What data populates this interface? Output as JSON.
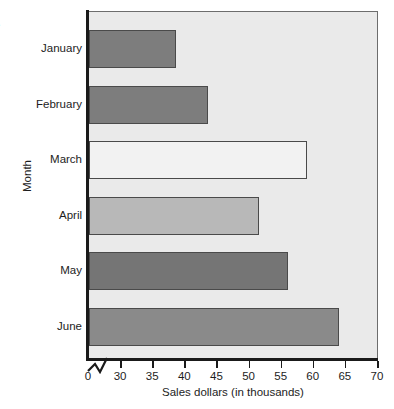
{
  "clipped_title_fragment": "e",
  "chart_data": {
    "type": "bar",
    "orientation": "horizontal",
    "title": "",
    "categories": [
      "January",
      "February",
      "March",
      "April",
      "May",
      "June"
    ],
    "values": [
      38.5,
      43.5,
      59,
      51.5,
      56,
      64
    ],
    "series": [
      {
        "name": "Sales dollars (in thousands)",
        "values": [
          38.5,
          43.5,
          59,
          51.5,
          56,
          64
        ]
      }
    ],
    "bar_colors": [
      "#7d7d7d",
      "#7d7d7d",
      "#f2f2f2",
      "#b8b8b8",
      "#757575",
      "#8a8a8a"
    ],
    "bar_edge_color": "#4a4a4a",
    "xlabel": "Sales dollars (in thousands)",
    "ylabel": "Month",
    "xlim": [
      25,
      70
    ],
    "x_axis_break": true,
    "x_axis_break_note": "axis broken between 0 and 30",
    "xticks": [
      0,
      30,
      35,
      40,
      45,
      50,
      55,
      60,
      65,
      70
    ],
    "xtick_labels": [
      "0",
      "30",
      "35",
      "40",
      "45",
      "50",
      "55",
      "60",
      "65",
      "70"
    ],
    "grid": false,
    "legend": null,
    "plot_background": "#eaeaea",
    "axis_color": "#1a1a1a"
  }
}
